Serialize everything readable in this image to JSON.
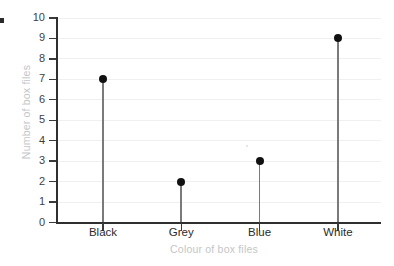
{
  "chart_data": {
    "type": "scatter",
    "title": "",
    "xlabel": "Colour of box files",
    "ylabel": "Number of box files",
    "categories": [
      "Black",
      "Grey",
      "Blue",
      "White"
    ],
    "values": [
      7,
      2,
      3,
      9
    ],
    "series": [
      {
        "name": "Number of box files",
        "values": [
          7,
          2,
          3,
          9
        ]
      }
    ],
    "ylim": [
      0,
      10
    ],
    "ytick_labels": [
      "0",
      "1",
      "2",
      "3",
      "4",
      "5",
      "6",
      "7",
      "8",
      "9",
      "10"
    ],
    "ytick_values": [
      0,
      1,
      2,
      3,
      4,
      5,
      6,
      7,
      8,
      9,
      10
    ],
    "grid": true,
    "legend": false,
    "legend_position": "none",
    "marker": "filled-circle",
    "stems": true,
    "colors": {
      "marker": "#111111",
      "stem": "#7a7a7a",
      "axis": "#2f2f2f",
      "gridline": "#f0f0f0",
      "tick_label": "#3f3f3f",
      "axis_title": "#c3c6c8",
      "background": "#ffffff"
    }
  }
}
